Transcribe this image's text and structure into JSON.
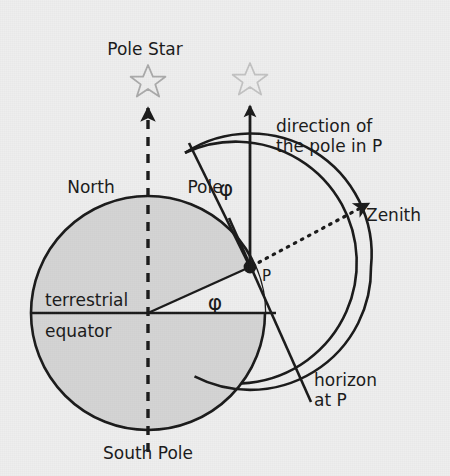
{
  "figure": {
    "type": "geometry-diagram",
    "background_color": "#eeeeee",
    "ink_color": "#1a1a1a",
    "earth_fill_color": "#d4d4d4",
    "sector_fill_color": "#eeeeee"
  },
  "labels": {
    "pole_star": "Pole Star",
    "north_pole": "North Pole",
    "south_pole": "South Pole",
    "terrestrial": "terrestrial",
    "equator": "equator",
    "direction_line1": "direction of",
    "direction_line2": "the pole in P",
    "zenith": "Zenith",
    "horizon_line1": "horizon",
    "horizon_line2": "at P",
    "point_p": "P",
    "phi_upper": "φ",
    "phi_lower": "φ"
  },
  "geometry": {
    "earth_center": {
      "x": 148,
      "y": 313
    },
    "earth_radius": 117,
    "point_p": {
      "x": 250,
      "y": 267
    },
    "latitude_phi_degrees": 24,
    "celestial_arc_radius": 121,
    "polar_axis_x": 148,
    "equator_y": 313
  },
  "icons": {
    "star_left": "star-icon",
    "star_right": "star-icon",
    "arrow_axis": "dashed-arrow-up-icon",
    "arrow_pole_direction": "solid-arrow-up-icon",
    "arrow_zenith": "dotted-arrow-icon",
    "point_marker": "filled-dot-icon"
  }
}
